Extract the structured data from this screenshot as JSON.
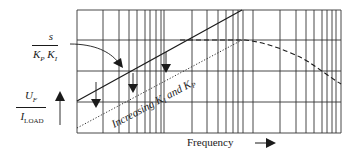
{
  "diagram": {
    "type": "bode-magnitude-plot",
    "labels": {
      "top_numerator": "s",
      "top_denominator_k1": "K",
      "top_denominator_k1_sub": "P",
      "top_denominator_k2": "K",
      "top_denominator_k2_sub": "I",
      "left_numerator": "U",
      "left_numerator_sub": "F",
      "left_denominator": "I",
      "left_denominator_sub": "LOAD",
      "xaxis": "Frequency",
      "annotation": "Increasing K",
      "annotation_sub1": "I",
      "annotation_mid": " and K",
      "annotation_sub2": "P"
    },
    "grid": {
      "left": 77,
      "right": 341,
      "top": 10,
      "bottom": 133,
      "horizontal_lines": [
        10,
        40,
        71,
        102,
        133
      ],
      "vertical_lines": [
        77,
        103,
        119,
        129,
        137,
        145,
        150,
        156,
        161,
        164,
        192,
        207,
        218,
        226,
        233,
        238,
        243,
        253,
        280,
        296,
        306,
        314,
        322,
        327,
        332,
        336,
        341
      ]
    },
    "curves": {
      "solid_line": {
        "from": [
          77,
          101
        ],
        "to": [
          242,
          10
        ]
      },
      "dotted_line": {
        "from": [
          77,
          128
        ],
        "to": [
          242,
          40
        ]
      },
      "dashed_curve": [
        [
          180,
          40
        ],
        [
          245,
          40
        ],
        [
          270,
          45
        ],
        [
          300,
          57
        ],
        [
          320,
          70
        ],
        [
          341,
          84
        ]
      ]
    },
    "colors": {
      "ink": "#1a1a1a",
      "grid": "#333333"
    }
  }
}
